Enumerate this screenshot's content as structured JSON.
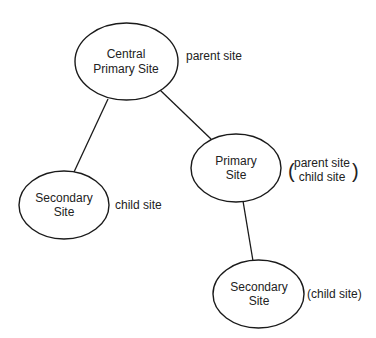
{
  "diagram": {
    "nodes": [
      {
        "id": "central",
        "lines": [
          "Central",
          "Primary Site"
        ],
        "annotation": [
          "parent site"
        ]
      },
      {
        "id": "primary",
        "lines": [
          "Primary",
          "Site"
        ],
        "annotation": [
          "parent site",
          "child site"
        ],
        "annotation_bracket": [
          "(",
          ")"
        ]
      },
      {
        "id": "secondary_left",
        "lines": [
          "Secondary",
          "Site"
        ],
        "annotation": [
          "child site"
        ]
      },
      {
        "id": "secondary_bottom",
        "lines": [
          "Secondary",
          "Site"
        ],
        "annotation": [
          "(child site)"
        ]
      }
    ],
    "edges": [
      {
        "from": "central",
        "to": "secondary_left"
      },
      {
        "from": "central",
        "to": "primary"
      },
      {
        "from": "primary",
        "to": "secondary_bottom"
      }
    ],
    "colors": {
      "stroke": "#1a1a1a",
      "text": "#222222",
      "background": "#ffffff"
    }
  }
}
